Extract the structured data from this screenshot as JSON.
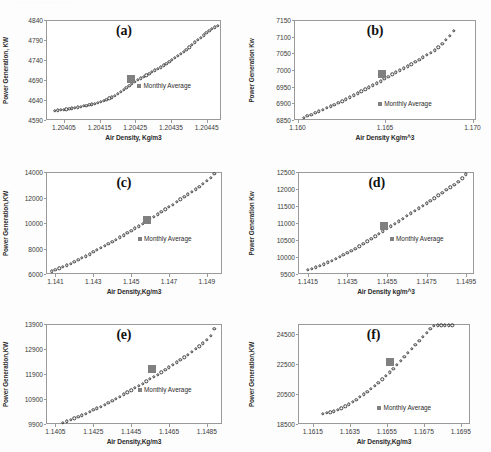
{
  "figure": {
    "caption_fragment": "· ·  ·   ·    ·  ·    ·   ·   ·    ·     ·   ·     ·    ·    ·   ·",
    "legend_label": "Monthly Average",
    "marker_color": "#808080",
    "point_color": "#3c3c3c",
    "axis_color": "#9a9a9a",
    "background": "#ffffff"
  },
  "chart_data": [
    {
      "id": "a",
      "type": "scatter",
      "title": "(a)",
      "xlabel": "Air Density, Kg/m3",
      "ylabel": "Power Generation, KW",
      "xlim": [
        1.204,
        1.20449
      ],
      "ylim": [
        4590,
        4840
      ],
      "xticks": [
        "1.20405",
        "1.20415",
        "1.20425",
        "1.20435",
        "1.20445"
      ],
      "xtick_values": [
        1.20405,
        1.20415,
        1.20425,
        1.20435,
        1.20445
      ],
      "yticks": [
        "4590",
        "4640",
        "4690",
        "4740",
        "4790",
        "4840"
      ],
      "ytick_values": [
        4590,
        4640,
        4690,
        4740,
        4790,
        4840
      ],
      "legend": "Monthly Average",
      "legend_pos": "center-right",
      "grid": false,
      "series": [
        {
          "name": "Hourly Power",
          "x": [
            1.204025,
            1.204033,
            1.204041,
            1.204049,
            1.204057,
            1.204065,
            1.204073,
            1.204081,
            1.204089,
            1.204097,
            1.204105,
            1.204113,
            1.204121,
            1.204129,
            1.204137,
            1.204145,
            1.204153,
            1.204161,
            1.204169,
            1.204177,
            1.204185,
            1.204193,
            1.204201,
            1.204209,
            1.204217,
            1.204225,
            1.204233,
            1.204241,
            1.204249,
            1.204257,
            1.204265,
            1.204273,
            1.204281,
            1.204289,
            1.204297,
            1.204305,
            1.204313,
            1.204321,
            1.204329,
            1.204337,
            1.204345,
            1.204353,
            1.204361,
            1.204369,
            1.204377,
            1.204385,
            1.204393,
            1.204401,
            1.204409,
            1.204417,
            1.204425,
            1.204433,
            1.204441,
            1.204449,
            1.204457,
            1.204465,
            1.204473,
            1.204481
          ],
          "y": [
            4613,
            4614,
            4615,
            4616,
            4617,
            4618,
            4619,
            4621,
            4622,
            4623,
            4625,
            4626,
            4628,
            4629,
            4631,
            4633,
            4635,
            4638,
            4640,
            4644,
            4647,
            4651,
            4655,
            4660,
            4665,
            4670,
            4675,
            4680,
            4686,
            4690,
            4694,
            4698,
            4702,
            4706,
            4710,
            4714,
            4718,
            4722,
            4727,
            4731,
            4736,
            4740,
            4745,
            4750,
            4755,
            4760,
            4766,
            4772,
            4778,
            4784,
            4790,
            4796,
            4802,
            4808,
            4813,
            4818,
            4822,
            4826
          ]
        }
      ],
      "monthly_average": {
        "x": 1.204237,
        "y": 4692
      }
    },
    {
      "id": "b",
      "type": "scatter",
      "title": "(b)",
      "xlabel": "Air Density Kg/m^3",
      "ylabel": "Power Generation Kw",
      "xlim": [
        1.1598,
        1.1702
      ],
      "ylim": [
        6850,
        7150
      ],
      "xticks": [
        "1.160",
        "1.165",
        "1.170"
      ],
      "xtick_values": [
        1.16,
        1.165,
        1.17
      ],
      "yticks": [
        "6850",
        "6900",
        "6950",
        "7000",
        "7050",
        "7100",
        "7150"
      ],
      "ytick_values": [
        6850,
        6900,
        6950,
        7000,
        7050,
        7100,
        7150
      ],
      "legend": "Monthly Average",
      "legend_pos": "bottom-center-right",
      "grid": false,
      "series": [
        {
          "name": "Hourly Power",
          "x": [
            1.16035,
            1.16057,
            1.16079,
            1.16101,
            1.16123,
            1.16145,
            1.16167,
            1.16189,
            1.16211,
            1.16233,
            1.16255,
            1.16277,
            1.16299,
            1.16321,
            1.16343,
            1.16365,
            1.16387,
            1.16409,
            1.16431,
            1.16453,
            1.16475,
            1.16497,
            1.16519,
            1.16541,
            1.16563,
            1.16585,
            1.16607,
            1.16629,
            1.16651,
            1.16673,
            1.16695,
            1.16717,
            1.16739,
            1.16761,
            1.16783,
            1.16805,
            1.16827,
            1.16849,
            1.16871,
            1.16893
          ],
          "y": [
            6857,
            6862,
            6866,
            6871,
            6876,
            6881,
            6886,
            6891,
            6896,
            6901,
            6906,
            6912,
            6918,
            6924,
            6930,
            6936,
            6942,
            6948,
            6954,
            6960,
            6966,
            6973,
            6980,
            6987,
            6993,
            6999,
            7005,
            7011,
            7017,
            7024,
            7031,
            7038,
            7045,
            7052,
            7059,
            7068,
            7078,
            7090,
            7103,
            7118
          ]
        }
      ],
      "monthly_average": {
        "x": 1.16482,
        "y": 6987
      }
    },
    {
      "id": "c",
      "type": "scatter",
      "title": "(c)",
      "xlabel": "Air Density,Kg/m3",
      "ylabel": "Power Generation,KW",
      "xlim": [
        1.1405,
        1.1498
      ],
      "ylim": [
        6000,
        14000
      ],
      "xticks": [
        "1.141",
        "1.143",
        "1.145",
        "1.147",
        "1.149"
      ],
      "xtick_values": [
        1.141,
        1.143,
        1.145,
        1.147,
        1.149
      ],
      "yticks": [
        "6000",
        "8000",
        "10000",
        "12000",
        "14000"
      ],
      "ytick_values": [
        6000,
        8000,
        10000,
        12000,
        14000
      ],
      "legend": "Monthly Average",
      "legend_pos": "center-right",
      "grid": false,
      "series": [
        {
          "name": "Hourly Power",
          "x": [
            1.1408,
            1.141,
            1.1412,
            1.1414,
            1.1416,
            1.1418,
            1.142,
            1.1422,
            1.1424,
            1.1426,
            1.1428,
            1.143,
            1.1432,
            1.1434,
            1.1436,
            1.1438,
            1.144,
            1.1442,
            1.1444,
            1.1446,
            1.1448,
            1.145,
            1.1452,
            1.1454,
            1.1456,
            1.1458,
            1.146,
            1.1462,
            1.1464,
            1.1466,
            1.1468,
            1.147,
            1.1472,
            1.1474,
            1.1476,
            1.1478,
            1.148,
            1.1482,
            1.1484,
            1.1486,
            1.1488,
            1.149,
            1.1492,
            1.1494
          ],
          "y": [
            6200,
            6320,
            6440,
            6560,
            6690,
            6820,
            6960,
            7100,
            7250,
            7400,
            7560,
            7720,
            7880,
            8040,
            8200,
            8360,
            8530,
            8700,
            8870,
            9040,
            9210,
            9390,
            9570,
            9750,
            9930,
            10120,
            10310,
            10500,
            10690,
            10880,
            11070,
            11260,
            11450,
            11650,
            11850,
            12050,
            12250,
            12450,
            12650,
            12860,
            13080,
            13300,
            13560,
            13850
          ]
        }
      ],
      "monthly_average": {
        "x": 1.14585,
        "y": 10200
      }
    },
    {
      "id": "d",
      "type": "scatter",
      "title": "(d)",
      "xlabel": "Air Density kg/m^3",
      "ylabel": "Power Generation Kw",
      "xlim": [
        1.141,
        1.1499
      ],
      "ylim": [
        9500,
        12500
      ],
      "xticks": [
        "1.1415",
        "1.1435",
        "1.1455",
        "1.1475",
        "1.1495"
      ],
      "xtick_values": [
        1.1415,
        1.1435,
        1.1455,
        1.1475,
        1.1495
      ],
      "yticks": [
        "9500",
        "10000",
        "10500",
        "11000",
        "11500",
        "12000",
        "12500"
      ],
      "ytick_values": [
        9500,
        10000,
        10500,
        11000,
        11500,
        12000,
        12500
      ],
      "legend": "Monthly Average",
      "legend_pos": "center-right",
      "grid": false,
      "series": [
        {
          "name": "Hourly Power",
          "x": [
            1.1415,
            1.1417,
            1.1419,
            1.1421,
            1.1423,
            1.1425,
            1.1427,
            1.1429,
            1.1431,
            1.1433,
            1.1435,
            1.1437,
            1.1439,
            1.1441,
            1.1443,
            1.1445,
            1.1447,
            1.1449,
            1.1451,
            1.1453,
            1.1455,
            1.1457,
            1.1459,
            1.1461,
            1.1463,
            1.1465,
            1.1467,
            1.1469,
            1.1471,
            1.1473,
            1.1475,
            1.1477,
            1.1479,
            1.1481,
            1.1483,
            1.1485,
            1.1487,
            1.1489,
            1.1491,
            1.1493,
            1.1495
          ],
          "y": [
            9620,
            9660,
            9700,
            9745,
            9790,
            9840,
            9890,
            9945,
            10000,
            10060,
            10120,
            10185,
            10250,
            10320,
            10390,
            10460,
            10530,
            10605,
            10680,
            10755,
            10830,
            10905,
            10980,
            11055,
            11130,
            11205,
            11280,
            11355,
            11430,
            11505,
            11580,
            11655,
            11730,
            11810,
            11890,
            11970,
            12050,
            12130,
            12215,
            12310,
            12430
          ]
        }
      ],
      "monthly_average": {
        "x": 1.14535,
        "y": 10900
      }
    },
    {
      "id": "e",
      "type": "scatter",
      "title": "(e)",
      "xlabel": "Air Density,Kg/m3",
      "ylabel": "Power Generation,KW",
      "xlim": [
        1.14,
        1.1493
      ],
      "ylim": [
        9900,
        13900
      ],
      "xticks": [
        "1.1405",
        "1.1425",
        "1.1445",
        "1.1465",
        "1.1485"
      ],
      "xtick_values": [
        1.1405,
        1.1425,
        1.1445,
        1.1465,
        1.1485
      ],
      "yticks": [
        "9900",
        "10900",
        "11900",
        "12900",
        "13900"
      ],
      "ytick_values": [
        9900,
        10900,
        11900,
        12900,
        13900
      ],
      "legend": "Monthly Average",
      "legend_pos": "center-right",
      "grid": false,
      "series": [
        {
          "name": "Hourly Power",
          "x": [
            1.1409,
            1.1411,
            1.1413,
            1.1415,
            1.1417,
            1.1419,
            1.1421,
            1.1423,
            1.1425,
            1.1427,
            1.1429,
            1.1431,
            1.1433,
            1.1435,
            1.1437,
            1.1439,
            1.1441,
            1.1443,
            1.1445,
            1.1447,
            1.1449,
            1.1451,
            1.1453,
            1.1455,
            1.1457,
            1.1459,
            1.1461,
            1.1463,
            1.1465,
            1.1467,
            1.1469,
            1.1471,
            1.1473,
            1.1475,
            1.1477,
            1.1479,
            1.1481,
            1.1483,
            1.1485,
            1.1487,
            1.1489
          ],
          "y": [
            9960,
            10010,
            10070,
            10130,
            10190,
            10255,
            10320,
            10390,
            10460,
            10530,
            10600,
            10680,
            10760,
            10840,
            10920,
            11000,
            11085,
            11170,
            11255,
            11340,
            11430,
            11520,
            11610,
            11700,
            11790,
            11880,
            11975,
            12070,
            12170,
            12270,
            12370,
            12470,
            12570,
            12680,
            12790,
            12900,
            13010,
            13130,
            13260,
            13430,
            13700
          ]
        }
      ],
      "monthly_average": {
        "x": 1.1456,
        "y": 12120
      }
    },
    {
      "id": "f",
      "type": "scatter",
      "title": "(f)",
      "xlabel": "Air Density,Kg/m3",
      "ylabel": "Power Generation,KW",
      "xlim": [
        1.1607,
        1.17
      ],
      "ylim": [
        18500,
        25200
      ],
      "xticks": [
        "1.1615",
        "1.1635",
        "1.1655",
        "1.1675",
        "1.1695"
      ],
      "xtick_values": [
        1.1615,
        1.1635,
        1.1655,
        1.1675,
        1.1695
      ],
      "yticks": [
        "18500",
        "20500",
        "22500",
        "24500"
      ],
      "ytick_values": [
        18500,
        20500,
        22500,
        24500
      ],
      "legend": "Monthly Average",
      "legend_pos": "bottom-center-right",
      "grid": false,
      "notes": "Output saturates at rated power near 25100 kW above ~1.1680 kg/m3",
      "series": [
        {
          "name": "Hourly Power",
          "x": [
            1.16205,
            1.16225,
            1.16245,
            1.16265,
            1.16285,
            1.16305,
            1.16325,
            1.16345,
            1.16365,
            1.16385,
            1.16405,
            1.16425,
            1.16445,
            1.16465,
            1.16485,
            1.16505,
            1.16525,
            1.16545,
            1.16565,
            1.16585,
            1.16605,
            1.16625,
            1.16645,
            1.16665,
            1.16685,
            1.16705,
            1.16725,
            1.16745,
            1.16765,
            1.16785,
            1.16805,
            1.16825,
            1.16845,
            1.16865,
            1.16885,
            1.16905
          ],
          "y": [
            19180,
            19230,
            19290,
            19360,
            19450,
            19560,
            19690,
            19830,
            19980,
            20140,
            20310,
            20490,
            20670,
            20860,
            21060,
            21270,
            21490,
            21720,
            21960,
            22210,
            22470,
            22740,
            23010,
            23280,
            23550,
            23820,
            24090,
            24360,
            24620,
            24860,
            25060,
            25100,
            25100,
            25100,
            25100,
            25100
          ]
        }
      ],
      "monthly_average": {
        "x": 1.16565,
        "y": 22650
      }
    }
  ]
}
